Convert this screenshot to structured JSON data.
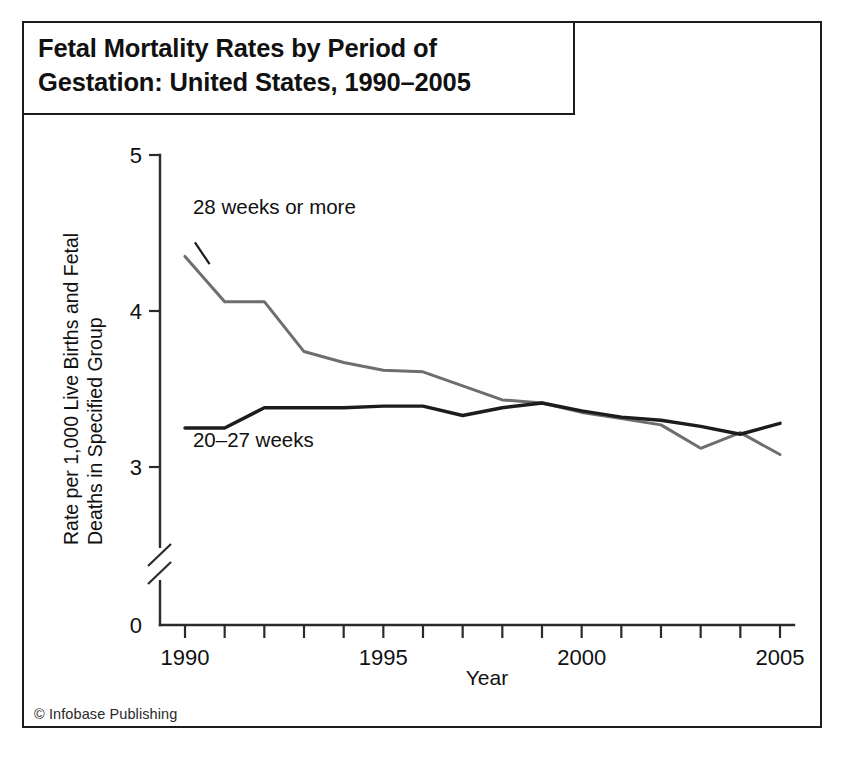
{
  "figure": {
    "title": "Fetal Mortality Rates by Period of\nGestation: United States, 1990–2005",
    "credit": "© Infobase Publishing"
  },
  "chart_data": {
    "type": "line",
    "title": "Fetal Mortality Rates by Period of Gestation: United States, 1990–2005",
    "xlabel": "Year",
    "ylabel": "Rate per 1,000 Live Births and Fetal Deaths in Specified Group",
    "x": [
      1990,
      1991,
      1992,
      1993,
      1994,
      1995,
      1996,
      1997,
      1998,
      1999,
      2000,
      2001,
      2002,
      2003,
      2004,
      2005
    ],
    "xlim": [
      1990,
      2005
    ],
    "xticks": [
      1990,
      1991,
      1992,
      1993,
      1994,
      1995,
      1996,
      1997,
      1998,
      1999,
      2000,
      2001,
      2002,
      2003,
      2004,
      2005
    ],
    "xticklabels": [
      "1990",
      "",
      "",
      "",
      "",
      "1995",
      "",
      "",
      "",
      "",
      "2000",
      "",
      "",
      "",
      "",
      "2005"
    ],
    "ylim": [
      3,
      5
    ],
    "yticks": [
      3,
      4,
      5
    ],
    "yticklabels": [
      "3",
      "4",
      "5"
    ],
    "y_zero_label": "0",
    "axis_break": true,
    "grid": false,
    "legend": "inline-labels",
    "series": [
      {
        "name": "28 weeks or more",
        "color": "#6e6e6e",
        "label_x": 1990.2,
        "label_y": 4.62,
        "values": [
          4.35,
          4.06,
          4.06,
          3.74,
          3.67,
          3.62,
          3.61,
          3.52,
          3.43,
          3.41,
          3.35,
          3.31,
          3.27,
          3.12,
          3.22,
          3.08
        ]
      },
      {
        "name": "20–27 weeks",
        "color": "#1c1c1c",
        "label_x": 1990.2,
        "label_y": 3.13,
        "values": [
          3.25,
          3.25,
          3.38,
          3.38,
          3.38,
          3.39,
          3.39,
          3.33,
          3.38,
          3.41,
          3.36,
          3.32,
          3.3,
          3.26,
          3.21,
          3.28
        ]
      }
    ]
  }
}
